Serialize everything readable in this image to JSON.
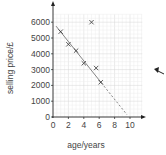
{
  "chart_data": {
    "type": "scatter",
    "title": "",
    "xlabel": "age/years",
    "ylabel": "selling price/£",
    "xlim": [
      0,
      12
    ],
    "ylim": [
      0,
      6600
    ],
    "x_ticks": [
      0,
      2,
      4,
      6,
      8,
      10
    ],
    "y_ticks": [
      0,
      1000,
      2000,
      3000,
      4000,
      5000,
      6000
    ],
    "x_tick_labels": [
      "0",
      "2",
      "4",
      "6",
      "8",
      "10"
    ],
    "y_tick_labels": [
      "0",
      "1000",
      "2000",
      "3000",
      "4000",
      "5000",
      "6000"
    ],
    "grid": true,
    "legend": null,
    "series": [
      {
        "name": "cars",
        "marker": "x",
        "points": [
          {
            "x": 1,
            "y": 5400
          },
          {
            "x": 2,
            "y": 4600
          },
          {
            "x": 3,
            "y": 4200
          },
          {
            "x": 4,
            "y": 3400
          },
          {
            "x": 5,
            "y": 6000
          },
          {
            "x": 5.6,
            "y": 3100
          },
          {
            "x": 6.2,
            "y": 2200
          }
        ]
      }
    ],
    "line_of_best_fit": {
      "solid": {
        "x1": 0.4,
        "y1": 5750,
        "x2": 6.3,
        "y2": 2150
      },
      "dashed_extrapolation": {
        "x1": 6.3,
        "y1": 2150,
        "x2": 9.6,
        "y2": 150
      }
    },
    "annotations": [
      {
        "type": "arrow",
        "direction": "up-left",
        "position": "right of chart"
      }
    ]
  },
  "colors": {
    "axis": "#222222",
    "grid_major": "#d6d6d6",
    "grid_minor": "#ececec",
    "marker": "#333333",
    "fit_line": "#777777",
    "arrow": "#222222"
  }
}
